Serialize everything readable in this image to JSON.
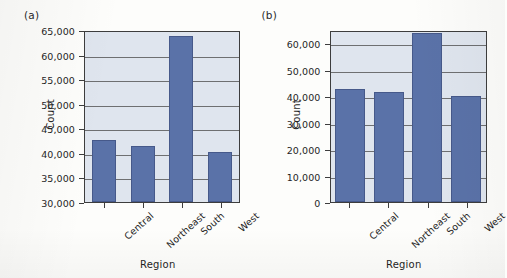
{
  "figure": {
    "panels": [
      {
        "tag": "(a)",
        "xlabel": "Region",
        "ylabel": "Count",
        "yticks": [
          "30,000",
          "35,000",
          "40,000",
          "45,000",
          "50,000",
          "55,000",
          "60,000",
          "65,000"
        ],
        "xticks": [
          "Central",
          "Northeast",
          "South",
          "West"
        ]
      },
      {
        "tag": "(b)",
        "xlabel": "Region",
        "ylabel": "Count",
        "yticks": [
          "0",
          "10,000",
          "20,000",
          "30,000",
          "40,000",
          "50,000",
          "60,000"
        ],
        "xticks": [
          "Central",
          "Northeast",
          "South",
          "West"
        ]
      }
    ]
  },
  "colors": {
    "bar": "#5a72a8",
    "bar_edge": "#46598a",
    "plot_background": "#dfe5ee",
    "gridline": "#5b5b5b",
    "axis": "#3d3d3d",
    "page": "#fdfdfb"
  },
  "chart_data": [
    {
      "type": "bar",
      "title": "(a)",
      "categories": [
        "Central",
        "Northeast",
        "South",
        "West"
      ],
      "values": [
        42700,
        41400,
        63700,
        40200
      ],
      "xlabel": "Region",
      "ylabel": "Count",
      "ylim": [
        30000,
        65000
      ],
      "ytick_values": [
        30000,
        35000,
        40000,
        45000,
        50000,
        55000,
        60000,
        65000
      ],
      "ytick_labels": [
        "30,000",
        "35,000",
        "40,000",
        "45,000",
        "50,000",
        "55,000",
        "60,000",
        "65,000"
      ],
      "ytick_step": 5000,
      "grid": true,
      "grid_axis": "y",
      "legend": null,
      "bar_color": "#5a72a8",
      "note": "Truncated y-axis starting at 30,000 exaggerates differences between regions"
    },
    {
      "type": "bar",
      "title": "(b)",
      "categories": [
        "Central",
        "Northeast",
        "South",
        "West"
      ],
      "values": [
        42700,
        41400,
        63700,
        40200
      ],
      "xlabel": "Region",
      "ylabel": "Count",
      "ylim": [
        0,
        65000
      ],
      "ytick_values": [
        0,
        10000,
        20000,
        30000,
        40000,
        50000,
        60000
      ],
      "ytick_labels": [
        "0",
        "10,000",
        "20,000",
        "30,000",
        "40,000",
        "50,000",
        "60,000"
      ],
      "ytick_step": 10000,
      "grid": true,
      "grid_axis": "y",
      "legend": null,
      "bar_color": "#5a72a8",
      "note": "Full y-axis beginning at zero shows true relative magnitudes"
    }
  ]
}
